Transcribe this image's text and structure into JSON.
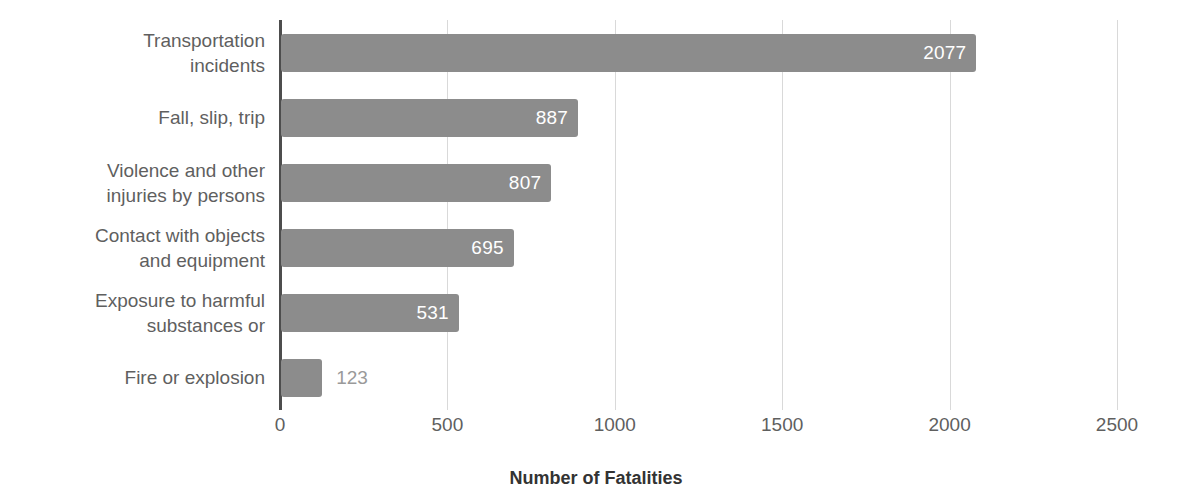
{
  "chart_data": {
    "type": "bar",
    "orientation": "horizontal",
    "title": "",
    "xlabel": "Number of Fatalities",
    "ylabel": "",
    "categories": [
      "Transportation\nincidents",
      "Fall, slip, trip",
      "Violence and other\ninjuries by persons",
      "Contact with objects\nand equipment",
      "Exposure to harmful\nsubstances or",
      "Fire or explosion"
    ],
    "values": [
      2077,
      887,
      807,
      695,
      531,
      123
    ],
    "data_labels": [
      "2077",
      "887",
      "807",
      "695",
      "531",
      "123"
    ],
    "label_placement": [
      "inside",
      "inside",
      "inside",
      "inside",
      "inside",
      "outside"
    ],
    "xlim": [
      0,
      2500
    ],
    "xticks": [
      0,
      500,
      1000,
      1500,
      2000,
      2500
    ],
    "xtick_labels": [
      "0",
      "500",
      "1000",
      "1500",
      "2000",
      "2500"
    ],
    "grid": true,
    "grid_axis": "x",
    "legend": false,
    "colors": {
      "bar": "#8c8c8c",
      "gridline": "#d9d9d9",
      "axis_line": "#4d4d4d",
      "label_text": "#5f5f5f",
      "inside_value_text": "#ffffff",
      "outside_value_text": "#9a9a9a",
      "axis_title_text": "#333333",
      "background": "#ffffff"
    }
  }
}
